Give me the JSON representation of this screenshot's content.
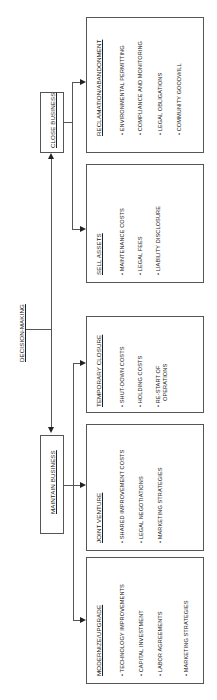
{
  "root": {
    "label": "DECISION-MAKING"
  },
  "close_business": {
    "label": "CLOSE BUSINESS",
    "options": [
      {
        "title": "RECLAMATION/ABANDONMENT",
        "items": [
          "• ENVIRONMENTAL PERMITTING",
          "• COMPLIANCE AND MONITORING",
          "• LEGAL OBLIGATIONS",
          "• COMMUNITY GOODWILL"
        ]
      },
      {
        "title": "SELL ASSETS",
        "items": [
          "• MAINTENANCE COSTS",
          "• LEGAL FEES",
          "• LIABILITY DISCLOSURE"
        ]
      }
    ]
  },
  "maintain_business": {
    "label": "MAINTAIN BUSINESS",
    "options": [
      {
        "title": "TEMPORARY CLOSURE",
        "items": [
          "• SHUT-DOWN COSTS",
          "• HOLDING COSTS",
          "• RE-START OF",
          "OPERATIONS"
        ]
      },
      {
        "title": "JOINT VENTURE",
        "items": [
          "• SHARED IMPROVEMENT COSTS",
          "• LEGAL NEGOTIATIONS",
          "• MARKETING STRATEGIES"
        ]
      },
      {
        "title": "MODERNIZE/UPGRADE",
        "items": [
          "• TECHNOLOGY IMPROVEMENTS",
          "• CAPITAL INVESTMENT",
          "• LABOR AGREEMENTS",
          "• MARKETING STRATEGIES"
        ]
      }
    ]
  }
}
